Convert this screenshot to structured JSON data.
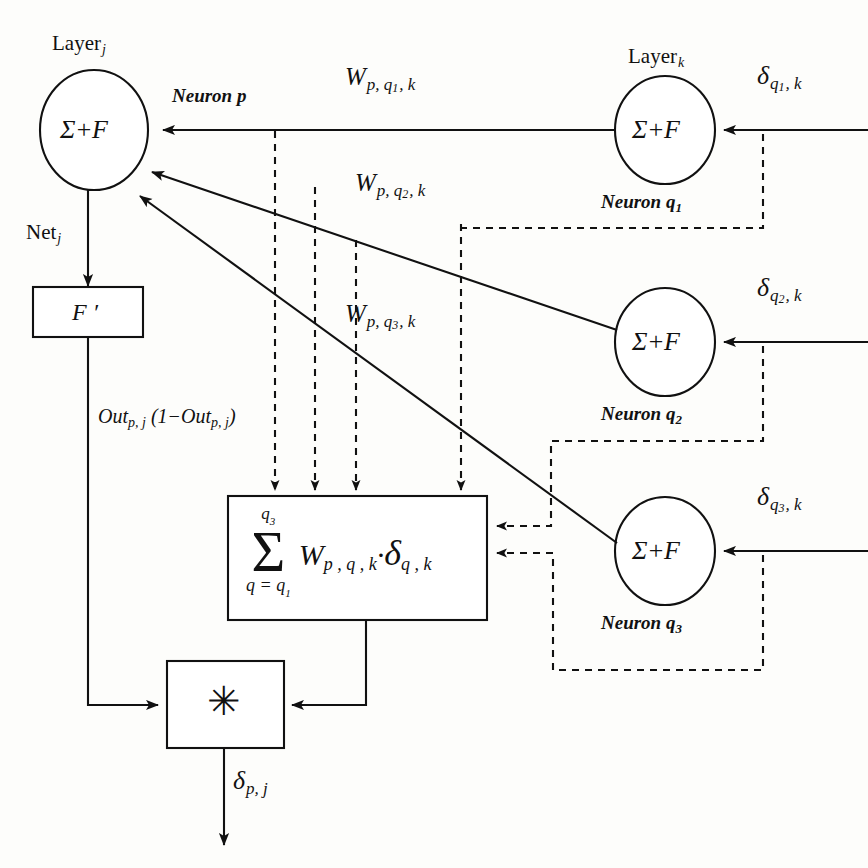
{
  "diagram": {
    "layers": {
      "left_label": "Layer",
      "left_sub": "j",
      "right_label": "Layer",
      "right_sub": "k"
    },
    "neuron_p": {
      "caption_word": "Neuron",
      "caption_sub": "p",
      "body": "Σ+F"
    },
    "neurons_k": [
      {
        "caption_word": "Neuron",
        "caption_sub": "q",
        "caption_sub2": "1",
        "body": "Σ+F",
        "delta_sym": "δ",
        "delta_s1": "q",
        "delta_s2": "1",
        "delta_s3": ", k"
      },
      {
        "caption_word": "Neuron",
        "caption_sub": "q",
        "caption_sub2": "2",
        "body": "Σ+F",
        "delta_sym": "δ",
        "delta_s1": "q",
        "delta_s2": "2",
        "delta_s3": ", k"
      },
      {
        "caption_word": "Neuron",
        "caption_sub": "q",
        "caption_sub2": "3",
        "body": "Σ+F",
        "delta_sym": "δ",
        "delta_s1": "q",
        "delta_s2": "3",
        "delta_s3": ", k"
      }
    ],
    "weights": [
      {
        "sym": "W",
        "s1": "p, q",
        "s2": "1",
        "s3": ", k"
      },
      {
        "sym": "W",
        "s1": "p, q",
        "s2": "2",
        "s3": ", k"
      },
      {
        "sym": "W",
        "s1": "p, q",
        "s2": "3",
        "s3": ", k"
      }
    ],
    "net_label": {
      "text": "Net",
      "sub": "j"
    },
    "fprime_box": {
      "label": "F ′"
    },
    "out_expression": {
      "lead": "Out",
      "lead_sub": "p, j",
      "mid": " (1",
      "minus": "−",
      "tail": "Out",
      "tail_sub": "p, j",
      "close": ")"
    },
    "sum_box": {
      "upper_limit_sym": "q",
      "upper_limit_sub": "3",
      "sigma": "Σ",
      "lower_limit": "q = q",
      "lower_limit_sub": "1",
      "body_w": "W",
      "body_w_sub": "p , q , k",
      "body_dot": "·",
      "body_delta": "δ",
      "body_delta_sub": "q , k"
    },
    "multiplier_box": {
      "symbol": "✳"
    },
    "output": {
      "sym": "δ",
      "sub": "p, j"
    },
    "colors": {
      "ink": "#111111",
      "paper": "#fdfdfb"
    }
  }
}
